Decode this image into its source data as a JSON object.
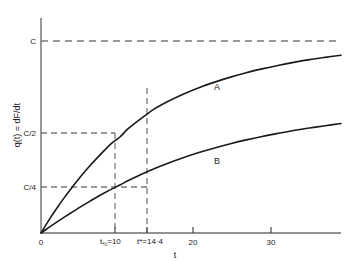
{
  "chart_data": {
    "type": "line",
    "title": "",
    "xlabel": "t",
    "ylabel": "q(t) = dF/dt",
    "ylabel_parts": {
      "q": "q(t)",
      "eq": "=",
      "deriv": "dF/dt"
    },
    "xlim": [
      0,
      38
    ],
    "ylim": [
      0,
      1.12
    ],
    "grid": false,
    "legend": "inline-curve-labels",
    "x_ticks": [
      {
        "value": 0,
        "label": "0"
      },
      {
        "value": 10,
        "label": "t½=10"
      },
      {
        "value": 14.4,
        "label": "t*=14·4"
      },
      {
        "value": 20,
        "label": "20"
      },
      {
        "value": 30,
        "label": "30"
      }
    ],
    "y_ticks": [
      {
        "value": 1.0,
        "label": "C"
      },
      {
        "value": 0.5,
        "label": "C/2"
      },
      {
        "value": 0.25,
        "label": "C/4"
      }
    ],
    "reference_lines": [
      {
        "orientation": "horizontal",
        "value": 1.0,
        "label": "C",
        "style": "dashed"
      },
      {
        "orientation": "horizontal",
        "value": 0.5,
        "label": "C/2",
        "style": "dashed"
      },
      {
        "orientation": "horizontal",
        "value": 0.25,
        "label": "C/4",
        "style": "dashed"
      },
      {
        "orientation": "vertical",
        "value": 10,
        "label": "t½=10",
        "style": "dashed"
      },
      {
        "orientation": "vertical",
        "value": 14.4,
        "label": "t*=14·4",
        "style": "dashed"
      }
    ],
    "series": [
      {
        "name": "A",
        "label": "A",
        "color": "#1a1a1a",
        "x": [
          0,
          1,
          2,
          3,
          4,
          5,
          6,
          7,
          8,
          9,
          10,
          11,
          12,
          13,
          14.4,
          16,
          18,
          20,
          22,
          24,
          26,
          28,
          30,
          32,
          34,
          36,
          38
        ],
        "y": [
          0,
          0.067,
          0.129,
          0.187,
          0.241,
          0.293,
          0.341,
          0.386,
          0.429,
          0.469,
          0.5,
          0.542,
          0.575,
          0.606,
          0.648,
          0.684,
          0.723,
          0.757,
          0.786,
          0.812,
          0.835,
          0.855,
          0.873,
          0.889,
          0.903,
          0.915,
          0.926
        ]
      },
      {
        "name": "B",
        "label": "B",
        "color": "#1a1a1a",
        "x": [
          0,
          1,
          2,
          3,
          4,
          5,
          6,
          7,
          8,
          9,
          10,
          11,
          12,
          13,
          14.4,
          16,
          18,
          20,
          22,
          24,
          26,
          28,
          30,
          32,
          34,
          36,
          38
        ],
        "y": [
          0,
          0.029,
          0.057,
          0.084,
          0.11,
          0.136,
          0.161,
          0.185,
          0.208,
          0.23,
          0.25,
          0.272,
          0.292,
          0.311,
          0.336,
          0.362,
          0.392,
          0.419,
          0.443,
          0.465,
          0.485,
          0.503,
          0.519,
          0.534,
          0.547,
          0.559,
          0.57
        ]
      }
    ],
    "annotations": [
      {
        "text": "A",
        "x": 24,
        "y": 0.76
      },
      {
        "text": "B",
        "x": 24,
        "y": 0.47
      }
    ],
    "colors": {
      "axis": "#6e6e6e",
      "curve": "#1a1a1a",
      "dash": "#7a7a7a",
      "background": "#ffffff"
    }
  }
}
